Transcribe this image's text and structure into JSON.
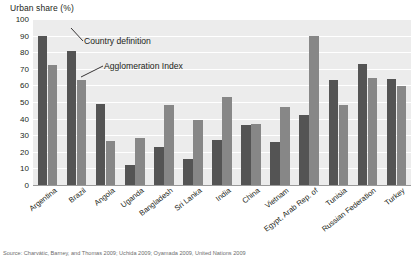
{
  "chart_data": {
    "type": "bar",
    "title": "",
    "ylabel": "Urban share (%)",
    "xlabel": "",
    "ylim": [
      0,
      100
    ],
    "yticks": [
      0,
      10,
      20,
      30,
      40,
      50,
      60,
      70,
      80,
      90,
      100
    ],
    "grid": true,
    "legend_position": "inline-annotation",
    "categories": [
      "Argentina",
      "Brazil",
      "Angola",
      "Uganda",
      "Bangladesh",
      "Sri Lanka",
      "India",
      "China",
      "Vietnam",
      "Egypt, Arab Rep. of",
      "Tunisia",
      "Russian Federation",
      "Turkey"
    ],
    "series": [
      {
        "name": "Country definition",
        "color": "#545454",
        "values": [
          90,
          81,
          49,
          12,
          23,
          15.5,
          27,
          36,
          26,
          42,
          63,
          73,
          64
        ]
      },
      {
        "name": "Agglomeration Index",
        "color": "#878787",
        "values": [
          72,
          63.5,
          26.5,
          28.5,
          48,
          39,
          53,
          37,
          47,
          90,
          48.5,
          64.5,
          59.5
        ]
      }
    ],
    "annotations": [
      {
        "text": "Country definition"
      },
      {
        "text": "Agglomeration Index"
      }
    ]
  },
  "source": {
    "text": "Source: Charvátic, Barney, and Thomas 2009; Uchida 2009; Oyamada 2009, United Nations 2009"
  },
  "colors": {
    "plot_background": "#ececec",
    "gridline": "#ffffff",
    "text": "#231f20",
    "country_definition": "#545454",
    "agglomeration_index": "#878787"
  }
}
